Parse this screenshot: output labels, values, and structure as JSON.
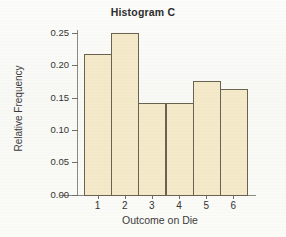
{
  "chart_data": {
    "type": "bar",
    "title": "Histogram C",
    "xlabel": "Outcome on Die",
    "ylabel": "Relative Frequency",
    "categories": [
      "1",
      "2",
      "3",
      "4",
      "5",
      "6"
    ],
    "values": [
      0.217,
      0.25,
      0.142,
      0.142,
      0.175,
      0.163
    ],
    "ylim": [
      0.0,
      0.25
    ],
    "ytick_labels": [
      "0.00",
      "0.05",
      "0.10",
      "0.15",
      "0.20",
      "0.25"
    ],
    "ytick_values": [
      0.0,
      0.05,
      0.1,
      0.15,
      0.2,
      0.25
    ],
    "xtick_labels": [
      "1",
      "2",
      "3",
      "4",
      "5",
      "6"
    ],
    "grid": false,
    "legend": false,
    "bar_fill_color": "#f4e9c9",
    "bar_border_color": "#6a6250",
    "axis_color": "#8a8a82",
    "text_color": "#333333"
  }
}
